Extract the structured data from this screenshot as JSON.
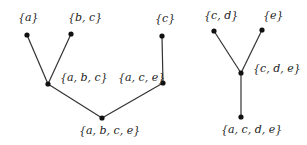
{
  "diagram": {
    "type": "tree",
    "trees": [
      {
        "name": "left-tree",
        "nodes": [
          {
            "id": "a",
            "label": "{a}",
            "x": 27,
            "y": 35,
            "lx": 18,
            "ly": 21
          },
          {
            "id": "bc",
            "label": "{b, c}",
            "x": 71,
            "y": 34,
            "lx": 68,
            "ly": 21
          },
          {
            "id": "abc",
            "label": "{a, b, c}",
            "x": 48,
            "y": 84,
            "lx": 60,
            "ly": 81
          },
          {
            "id": "c",
            "label": "{c}",
            "x": 162,
            "y": 36,
            "lx": 155,
            "ly": 22
          },
          {
            "id": "ace",
            "label": "{a, c, e}",
            "x": 163,
            "y": 83,
            "lx": 118,
            "ly": 81
          },
          {
            "id": "abce",
            "label": "{a, b, c, e}",
            "x": 102,
            "y": 118,
            "lx": 79,
            "ly": 134
          }
        ],
        "edges": [
          [
            "a",
            "abc"
          ],
          [
            "bc",
            "abc"
          ],
          [
            "abc",
            "abce"
          ],
          [
            "c",
            "ace"
          ],
          [
            "ace",
            "abce"
          ]
        ]
      },
      {
        "name": "right-tree",
        "nodes": [
          {
            "id": "cd",
            "label": "{c, d}",
            "x": 214,
            "y": 31,
            "lx": 204,
            "ly": 19
          },
          {
            "id": "e",
            "label": "{e}",
            "x": 262,
            "y": 30,
            "lx": 263,
            "ly": 19
          },
          {
            "id": "cde",
            "label": "{c, d, e}",
            "x": 241,
            "y": 73,
            "lx": 253,
            "ly": 72
          },
          {
            "id": "acde",
            "label": "{a, c, d, e}",
            "x": 241,
            "y": 117,
            "lx": 221,
            "ly": 133
          }
        ],
        "edges": [
          [
            "cd",
            "cde"
          ],
          [
            "e",
            "cde"
          ],
          [
            "cde",
            "acde"
          ]
        ]
      }
    ]
  }
}
